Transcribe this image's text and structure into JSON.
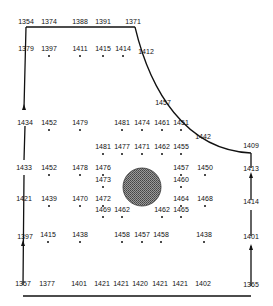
{
  "diagram": {
    "type": "contour-site-plan",
    "colors": {
      "line": "#111111",
      "feature_fill": "#777777",
      "background": "#ffffff"
    },
    "boundary_labels": [
      {
        "text": "1354",
        "x": 26,
        "y": 25
      },
      {
        "text": "1374",
        "x": 49,
        "y": 25
      },
      {
        "text": "1388",
        "x": 80,
        "y": 25
      },
      {
        "text": "1391",
        "x": 103,
        "y": 25
      },
      {
        "text": "1371",
        "x": 133,
        "y": 25
      },
      {
        "text": "1412",
        "x": 146,
        "y": 55
      },
      {
        "text": "1457",
        "x": 163,
        "y": 106
      },
      {
        "text": "1442",
        "x": 203,
        "y": 140
      },
      {
        "text": "1409",
        "x": 251,
        "y": 149
      },
      {
        "text": "1413",
        "x": 251,
        "y": 172
      },
      {
        "text": "1414",
        "x": 251,
        "y": 205
      },
      {
        "text": "1401",
        "x": 251,
        "y": 240
      },
      {
        "text": "1365",
        "x": 251,
        "y": 288
      },
      {
        "text": "1402",
        "x": 203,
        "y": 287
      },
      {
        "text": "1421",
        "x": 180,
        "y": 287
      },
      {
        "text": "1421",
        "x": 160,
        "y": 287
      },
      {
        "text": "1420",
        "x": 140,
        "y": 287
      },
      {
        "text": "1421",
        "x": 121,
        "y": 287
      },
      {
        "text": "1421",
        "x": 102,
        "y": 287
      },
      {
        "text": "1401",
        "x": 79,
        "y": 287
      },
      {
        "text": "1377",
        "x": 47,
        "y": 287
      },
      {
        "text": "1357",
        "x": 23,
        "y": 287
      },
      {
        "text": "1397",
        "x": 25,
        "y": 240
      },
      {
        "text": "1421",
        "x": 24,
        "y": 202
      },
      {
        "text": "1433",
        "x": 24,
        "y": 171
      },
      {
        "text": "1434",
        "x": 25,
        "y": 126
      },
      {
        "text": "1379",
        "x": 26,
        "y": 52
      }
    ],
    "interior_points": [
      {
        "text": "1397",
        "x": 49,
        "y": 52
      },
      {
        "text": "1411",
        "x": 80,
        "y": 52
      },
      {
        "text": "1415",
        "x": 103,
        "y": 52
      },
      {
        "text": "1414",
        "x": 123,
        "y": 52
      },
      {
        "text": "1452",
        "x": 49,
        "y": 126
      },
      {
        "text": "1479",
        "x": 80,
        "y": 126
      },
      {
        "text": "1481",
        "x": 122,
        "y": 126
      },
      {
        "text": "1474",
        "x": 142,
        "y": 126
      },
      {
        "text": "1461",
        "x": 162,
        "y": 126
      },
      {
        "text": "1451",
        "x": 181,
        "y": 126
      },
      {
        "text": "1481",
        "x": 103,
        "y": 150
      },
      {
        "text": "1477",
        "x": 122,
        "y": 150
      },
      {
        "text": "1471",
        "x": 142,
        "y": 150
      },
      {
        "text": "1462",
        "x": 162,
        "y": 150
      },
      {
        "text": "1455",
        "x": 181,
        "y": 150
      },
      {
        "text": "1452",
        "x": 49,
        "y": 171
      },
      {
        "text": "1478",
        "x": 80,
        "y": 171
      },
      {
        "text": "1476",
        "x": 103,
        "y": 171
      },
      {
        "text": "1457",
        "x": 181,
        "y": 171
      },
      {
        "text": "1450",
        "x": 205,
        "y": 171
      },
      {
        "text": "1473",
        "x": 103,
        "y": 183
      },
      {
        "text": "1460",
        "x": 181,
        "y": 183
      },
      {
        "text": "1439",
        "x": 49,
        "y": 202
      },
      {
        "text": "1470",
        "x": 80,
        "y": 202
      },
      {
        "text": "1472",
        "x": 103,
        "y": 202
      },
      {
        "text": "1464",
        "x": 181,
        "y": 202
      },
      {
        "text": "1468",
        "x": 205,
        "y": 202
      },
      {
        "text": "1469",
        "x": 103,
        "y": 213
      },
      {
        "text": "1462",
        "x": 122,
        "y": 213
      },
      {
        "text": "1462",
        "x": 162,
        "y": 213
      },
      {
        "text": "1465",
        "x": 181,
        "y": 213
      },
      {
        "text": "1415",
        "x": 48,
        "y": 238
      },
      {
        "text": "1438",
        "x": 80,
        "y": 238
      },
      {
        "text": "1458",
        "x": 122,
        "y": 238
      },
      {
        "text": "1457",
        "x": 142,
        "y": 238
      },
      {
        "text": "1458",
        "x": 161,
        "y": 238
      },
      {
        "text": "1438",
        "x": 204,
        "y": 238
      }
    ],
    "feature": {
      "name": "central-circular-feature",
      "cx": 142,
      "cy": 187,
      "r": 19
    }
  }
}
